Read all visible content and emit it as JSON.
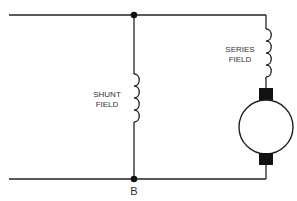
{
  "diagram": {
    "type": "circuit-schematic",
    "labels": {
      "shunt_field_line1": "SHUNT",
      "shunt_field_line2": "FIELD",
      "series_field_line1": "SERIES",
      "series_field_line2": "FIELD",
      "node_b": "B"
    },
    "components": [
      {
        "id": "shunt-field",
        "kind": "inductor",
        "label": "SHUNT FIELD"
      },
      {
        "id": "series-field",
        "kind": "inductor",
        "label": "SERIES FIELD"
      },
      {
        "id": "armature",
        "kind": "motor-armature-with-brushes",
        "label": ""
      }
    ],
    "nodes": [
      {
        "id": "top-junction",
        "label": ""
      },
      {
        "id": "B",
        "label": "B"
      }
    ],
    "colors": {
      "stroke": "#222222",
      "text": "#333333",
      "background": "#ffffff"
    }
  }
}
